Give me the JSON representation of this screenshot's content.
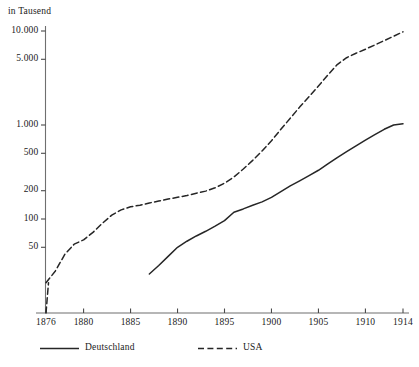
{
  "chart_data": {
    "type": "line",
    "title": "",
    "unit_label": "in Tausend",
    "xlabel": "",
    "ylabel": "in Tausend",
    "yscale": "log",
    "ylim": [
      20,
      12000
    ],
    "xlim": [
      1876,
      1914
    ],
    "grid": false,
    "legend_position": "bottom",
    "y_ticks": [
      {
        "value": 10000,
        "label": "10.000"
      },
      {
        "value": 5000,
        "label": "5.000"
      },
      {
        "value": 1000,
        "label": "1.000"
      },
      {
        "value": 500,
        "label": "500"
      },
      {
        "value": 200,
        "label": "200"
      },
      {
        "value": 100,
        "label": "100"
      },
      {
        "value": 50,
        "label": "50"
      }
    ],
    "x_ticks": [
      {
        "value": 1876,
        "label": "1876"
      },
      {
        "value": 1880,
        "label": "1880"
      },
      {
        "value": 1885,
        "label": "1885"
      },
      {
        "value": 1890,
        "label": "1890"
      },
      {
        "value": 1895,
        "label": "1895"
      },
      {
        "value": 1900,
        "label": "1900"
      },
      {
        "value": 1905,
        "label": "1905"
      },
      {
        "value": 1910,
        "label": "1910"
      },
      {
        "value": 1914,
        "label": "1914"
      }
    ],
    "series": [
      {
        "name": "Deutschland",
        "style": "solid",
        "x": [
          1887,
          1888,
          1889,
          1890,
          1891,
          1892,
          1893,
          1894,
          1895,
          1896,
          1897,
          1898,
          1899,
          1900,
          1901,
          1902,
          1903,
          1904,
          1905,
          1906,
          1907,
          1908,
          1909,
          1910,
          1911,
          1912,
          1913,
          1914
        ],
        "y": [
          26,
          32,
          40,
          50,
          58,
          66,
          74,
          84,
          96,
          118,
          128,
          140,
          152,
          170,
          196,
          225,
          255,
          290,
          330,
          385,
          450,
          520,
          600,
          690,
          790,
          900,
          1000,
          1030
        ]
      },
      {
        "name": "USA",
        "style": "dashed",
        "x": [
          1876,
          1877,
          1878,
          1879,
          1880,
          1881,
          1882,
          1883,
          1884,
          1885,
          1886,
          1887,
          1888,
          1889,
          1890,
          1891,
          1892,
          1893,
          1894,
          1895,
          1896,
          1897,
          1898,
          1899,
          1900,
          1901,
          1902,
          1903,
          1904,
          1905,
          1906,
          1907,
          1908,
          1909,
          1910,
          1911,
          1912,
          1913,
          1914
        ],
        "y": [
          21,
          28,
          42,
          54,
          60,
          72,
          90,
          110,
          125,
          135,
          140,
          148,
          155,
          163,
          170,
          178,
          188,
          198,
          215,
          240,
          280,
          340,
          420,
          530,
          680,
          900,
          1180,
          1550,
          2000,
          2600,
          3400,
          4400,
          5200,
          5800,
          6400,
          7100,
          7900,
          8800,
          9800
        ]
      }
    ]
  },
  "legend": {
    "items": [
      {
        "label": "Deutschland",
        "style": "solid"
      },
      {
        "label": "USA",
        "style": "dashed"
      }
    ]
  }
}
